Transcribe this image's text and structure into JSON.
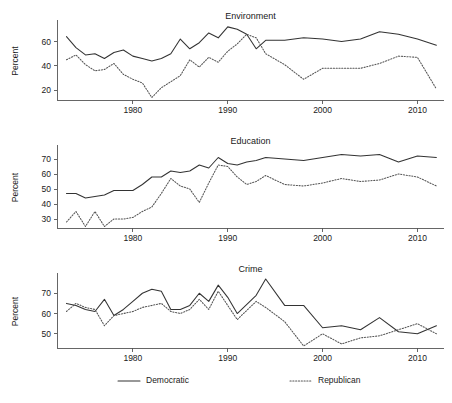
{
  "figure": {
    "panel_count": 3,
    "x_tick_years": [
      1980,
      1990,
      2000,
      2010
    ],
    "x_range": [
      1972.0,
      2012.8
    ],
    "axis_color": "#555555",
    "democratic_color": "#333333",
    "republican_color": "#555555"
  },
  "legend": {
    "position": "bottom-center",
    "entries": [
      {
        "label": "Democratic",
        "style": "solid"
      },
      {
        "label": "Republican",
        "style": "dotted"
      }
    ]
  },
  "chart_data": [
    {
      "type": "line",
      "title": "Environment",
      "xlabel": "",
      "ylabel": "Percent",
      "ylim": [
        12,
        76
      ],
      "yticks": [
        20,
        40,
        60
      ],
      "xlim": [
        1972.0,
        2012.8
      ],
      "xticks": [
        1980,
        1990,
        2000,
        2010
      ],
      "grid": false,
      "x": [
        1973,
        1974,
        1975,
        1976,
        1977,
        1978,
        1979,
        1980,
        1981,
        1982,
        1983,
        1984,
        1985,
        1986,
        1987,
        1988,
        1989,
        1990,
        1991,
        1992,
        1993,
        1994,
        1996,
        1998,
        2000,
        2002,
        2004,
        2006,
        2008,
        2010,
        2012
      ],
      "series": [
        {
          "name": "Democratic",
          "style": "solid",
          "values": [
            64,
            55,
            49,
            50,
            46,
            51,
            53,
            48,
            46,
            44,
            46,
            50,
            62,
            54,
            59,
            67,
            63,
            72,
            70,
            66,
            54,
            61,
            61,
            63,
            62,
            60,
            62,
            68,
            66,
            62,
            57
          ]
        },
        {
          "name": "Republican",
          "style": "dotted",
          "values": [
            45,
            49,
            41,
            36,
            37,
            42,
            33,
            29,
            26,
            14,
            22,
            27,
            32,
            45,
            39,
            47,
            43,
            52,
            58,
            66,
            63,
            50,
            41,
            29,
            38,
            38,
            38,
            42,
            48,
            47,
            21,
            16
          ]
        }
      ],
      "notes": "Democratic consistently above Republican; both peak around 1990, Republican drops sharply after 2008"
    },
    {
      "type": "line",
      "title": "Education",
      "xlabel": "",
      "ylabel": "Percent",
      "ylim": [
        24,
        78
      ],
      "yticks": [
        30,
        40,
        50,
        60,
        70
      ],
      "xlim": [
        1972.0,
        2012.8
      ],
      "xticks": [
        1980,
        1990,
        2000,
        2010
      ],
      "grid": false,
      "x": [
        1973,
        1974,
        1975,
        1976,
        1977,
        1978,
        1979,
        1980,
        1981,
        1982,
        1983,
        1984,
        1985,
        1986,
        1987,
        1988,
        1989,
        1990,
        1991,
        1992,
        1993,
        1994,
        1996,
        1998,
        2000,
        2002,
        2004,
        2006,
        2008,
        2010,
        2012
      ],
      "series": [
        {
          "name": "Democratic",
          "style": "solid",
          "values": [
            47,
            47,
            44,
            45,
            46,
            49,
            49,
            49,
            53,
            58,
            58,
            62,
            61,
            62,
            66,
            64,
            71,
            67,
            66,
            68,
            69,
            71,
            70,
            69,
            71,
            73,
            72,
            73,
            68,
            72,
            71
          ]
        },
        {
          "name": "Republican",
          "style": "dotted",
          "values": [
            28,
            35,
            25,
            35,
            25,
            30,
            30,
            31,
            35,
            38,
            47,
            57,
            52,
            50,
            41,
            54,
            66,
            65,
            58,
            53,
            55,
            59,
            53,
            52,
            54,
            57,
            55,
            56,
            60,
            58,
            52
          ]
        }
      ],
      "notes": "Both series rise over time; lines cross near 1990; Democratic remains above Republican after 1991"
    },
    {
      "type": "line",
      "title": "Crime",
      "xlabel": "",
      "ylabel": "Percent",
      "ylim": [
        43,
        79
      ],
      "yticks": [
        50,
        60,
        70
      ],
      "xlim": [
        1972.0,
        2012.8
      ],
      "xticks": [
        1980,
        1990,
        2000,
        2010
      ],
      "grid": false,
      "x": [
        1973,
        1974,
        1975,
        1976,
        1977,
        1978,
        1979,
        1980,
        1981,
        1982,
        1983,
        1984,
        1985,
        1986,
        1987,
        1988,
        1989,
        1990,
        1991,
        1993,
        1994,
        1996,
        1998,
        2000,
        2002,
        2004,
        2006,
        2008,
        2010,
        2012
      ],
      "series": [
        {
          "name": "Democratic",
          "style": "solid",
          "values": [
            65,
            64,
            62,
            61,
            67,
            59,
            62,
            66,
            70,
            72,
            71,
            62,
            62,
            64,
            70,
            66,
            74,
            68,
            60,
            69,
            77,
            64,
            64,
            53,
            54,
            52,
            58,
            51,
            50,
            54
          ]
        },
        {
          "name": "Republican",
          "style": "dotted",
          "values": [
            61,
            65,
            63,
            62,
            54,
            59,
            60,
            61,
            63,
            64,
            65,
            61,
            60,
            62,
            67,
            62,
            71,
            64,
            57,
            66,
            63,
            56,
            44,
            50,
            45,
            48,
            49,
            52,
            55,
            50
          ]
        }
      ],
      "notes": "Both series decline sharply after mid-1990s; Democratic peaks near 1994 at about 77"
    }
  ]
}
